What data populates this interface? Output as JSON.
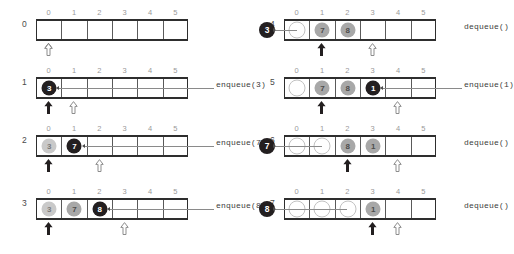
{
  "diagram": {
    "indices": [
      "0",
      "1",
      "2",
      "3",
      "4",
      "5"
    ],
    "capacity": 6,
    "colors": {
      "newest": "#231f20",
      "older": "#a8a8a8",
      "oldest": "#c9c9c9",
      "vacated": "#ffffff",
      "border": "#2e2e2e",
      "index_label": "#9a9a9a"
    },
    "pointers": {
      "front_style": "solid-black-arrow",
      "rear_style": "hollow-outline-arrow"
    },
    "steps": [
      {
        "step": "0",
        "op": "",
        "cells": [
          {
            "value": "",
            "style": "none"
          },
          {
            "value": "",
            "style": "none"
          },
          {
            "value": "",
            "style": "none"
          },
          {
            "value": "",
            "style": "none"
          },
          {
            "value": "",
            "style": "none"
          },
          {
            "value": "",
            "style": "none"
          }
        ],
        "front": 0,
        "rear": 0,
        "ejected": "",
        "enqueue_arrow_from": -1
      },
      {
        "step": "1",
        "op": "enqueue(3)",
        "cells": [
          {
            "value": "3",
            "style": "black"
          },
          {
            "value": "",
            "style": "none"
          },
          {
            "value": "",
            "style": "none"
          },
          {
            "value": "",
            "style": "none"
          },
          {
            "value": "",
            "style": "none"
          },
          {
            "value": "",
            "style": "none"
          }
        ],
        "front": 0,
        "rear": 1,
        "ejected": "",
        "enqueue_arrow_from": 4
      },
      {
        "step": "2",
        "op": "enqueue(7)",
        "cells": [
          {
            "value": "3",
            "style": "lightgray"
          },
          {
            "value": "7",
            "style": "black"
          },
          {
            "value": "",
            "style": "none"
          },
          {
            "value": "",
            "style": "none"
          },
          {
            "value": "",
            "style": "none"
          },
          {
            "value": "",
            "style": "none"
          }
        ],
        "front": 0,
        "rear": 2,
        "ejected": "",
        "enqueue_arrow_from": 5
      },
      {
        "step": "3",
        "op": "enqueue(8)",
        "cells": [
          {
            "value": "3",
            "style": "lightgray"
          },
          {
            "value": "7",
            "style": "gray"
          },
          {
            "value": "8",
            "style": "black"
          },
          {
            "value": "",
            "style": "none"
          },
          {
            "value": "",
            "style": "none"
          },
          {
            "value": "",
            "style": "none"
          }
        ],
        "front": 0,
        "rear": 3,
        "ejected": "",
        "enqueue_arrow_from": 6
      },
      {
        "step": "4",
        "op": "dequeue()",
        "cells": [
          {
            "value": "",
            "style": "empty"
          },
          {
            "value": "7",
            "style": "gray"
          },
          {
            "value": "8",
            "style": "gray"
          },
          {
            "value": "",
            "style": "none"
          },
          {
            "value": "",
            "style": "none"
          },
          {
            "value": "",
            "style": "none"
          }
        ],
        "front": 1,
        "rear": 3,
        "ejected": "3",
        "enqueue_arrow_from": -1
      },
      {
        "step": "5",
        "op": "enqueue(1)",
        "cells": [
          {
            "value": "",
            "style": "empty"
          },
          {
            "value": "7",
            "style": "gray"
          },
          {
            "value": "8",
            "style": "gray"
          },
          {
            "value": "1",
            "style": "black"
          },
          {
            "value": "",
            "style": "none"
          },
          {
            "value": "",
            "style": "none"
          }
        ],
        "front": 1,
        "rear": 4,
        "ejected": "",
        "enqueue_arrow_from": 6
      },
      {
        "step": "6",
        "op": "dequeue()",
        "cells": [
          {
            "value": "",
            "style": "empty"
          },
          {
            "value": "",
            "style": "empty"
          },
          {
            "value": "8",
            "style": "gray"
          },
          {
            "value": "1",
            "style": "gray"
          },
          {
            "value": "",
            "style": "none"
          },
          {
            "value": "",
            "style": "none"
          }
        ],
        "front": 2,
        "rear": 4,
        "ejected": "7",
        "enqueue_arrow_from": -1
      },
      {
        "step": "7",
        "op": "dequeue()",
        "cells": [
          {
            "value": "",
            "style": "empty"
          },
          {
            "value": "",
            "style": "empty"
          },
          {
            "value": "",
            "style": "empty"
          },
          {
            "value": "1",
            "style": "gray"
          },
          {
            "value": "",
            "style": "none"
          },
          {
            "value": "",
            "style": "none"
          }
        ],
        "front": 3,
        "rear": 4,
        "ejected": "8",
        "enqueue_arrow_from": -1
      }
    ]
  }
}
